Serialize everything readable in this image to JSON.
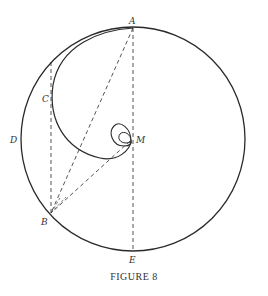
{
  "figure": {
    "caption": "FIGURE 8",
    "points": {
      "A": {
        "label": "A",
        "x": 133,
        "y": 27
      },
      "B": {
        "label": "B",
        "x": 50,
        "y": 213
      },
      "C": {
        "label": "C",
        "x": 51,
        "y": 100
      },
      "D": {
        "label": "D",
        "x": 20,
        "y": 140
      },
      "E": {
        "label": "E",
        "x": 133,
        "y": 250
      },
      "M": {
        "label": "M",
        "x": 133,
        "y": 140
      }
    },
    "colors": {
      "stroke": "#2a2a2a",
      "background": "#ffffff"
    }
  }
}
